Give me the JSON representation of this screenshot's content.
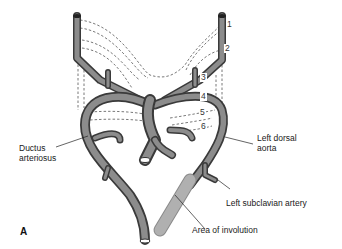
{
  "figure": {
    "panel_letter": "A",
    "arch_numbers": [
      "1",
      "2",
      "3",
      "4",
      "5",
      "6"
    ],
    "labels": {
      "ductus": [
        "Ductus",
        "arteriosus"
      ],
      "left_dorsal_aorta": [
        "Left dorsal",
        "aorta"
      ],
      "left_subclavian": "Left subclavian artery",
      "involution": "Area of involution"
    },
    "colors": {
      "vessel": "#7a7a7a",
      "vessel_dark": "#4a4a4a",
      "involution": "#a8a8a8",
      "dashed": "#555555"
    }
  }
}
